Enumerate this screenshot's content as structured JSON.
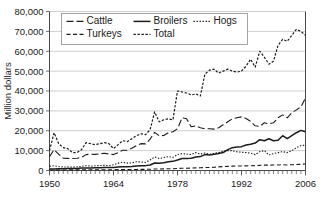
{
  "chart_data": {
    "type": "line",
    "title": "",
    "xlabel": "",
    "ylabel": "Million dollars",
    "xlim": [
      1950,
      2006
    ],
    "ylim": [
      0,
      80000
    ],
    "ytick_labels": [
      "0",
      "10,000",
      "20,000",
      "30,000",
      "40,000",
      "50,000",
      "60,000",
      "70,000",
      "80,000"
    ],
    "ytick_values": [
      0,
      10000,
      20000,
      30000,
      40000,
      50000,
      60000,
      70000,
      80000
    ],
    "xtick_labels": [
      "1950",
      "1964",
      "1978",
      "1992",
      "2006"
    ],
    "xtick_values": [
      1950,
      1964,
      1978,
      1992,
      2006
    ],
    "grid": "horizontal",
    "legend_position": "top-center",
    "x": [
      1950,
      1951,
      1952,
      1953,
      1954,
      1955,
      1956,
      1957,
      1958,
      1959,
      1960,
      1961,
      1962,
      1963,
      1964,
      1965,
      1966,
      1967,
      1968,
      1969,
      1970,
      1971,
      1972,
      1973,
      1974,
      1975,
      1976,
      1977,
      1978,
      1979,
      1980,
      1981,
      1982,
      1983,
      1984,
      1985,
      1986,
      1987,
      1988,
      1989,
      1990,
      1991,
      1992,
      1993,
      1994,
      1995,
      1996,
      1997,
      1998,
      1999,
      2000,
      2001,
      2002,
      2003,
      2004,
      2005,
      2006
    ],
    "series": [
      {
        "name": "Cattle",
        "dash": "dash-long",
        "values": [
          7000,
          10500,
          8200,
          6200,
          6100,
          6000,
          6200,
          6600,
          8000,
          8200,
          8100,
          8400,
          8700,
          8300,
          8000,
          9000,
          10200,
          10200,
          11200,
          12500,
          13500,
          13400,
          15800,
          19200,
          17500,
          17600,
          19000,
          19500,
          21000,
          26500,
          26000,
          22000,
          22500,
          21500,
          21000,
          21000,
          20800,
          21500,
          23000,
          24500,
          26000,
          26500,
          27000,
          26200,
          24700,
          22500,
          22200,
          24000,
          23500,
          24000,
          26500,
          28000,
          26500,
          29000,
          30500,
          32000,
          36500
        ]
      },
      {
        "name": "Broilers",
        "dash": "solid",
        "values": [
          700,
          800,
          850,
          900,
          950,
          1000,
          1050,
          1200,
          1300,
          1300,
          1350,
          1350,
          1450,
          1500,
          1550,
          1700,
          1900,
          1900,
          2050,
          2300,
          2450,
          2450,
          2800,
          3800,
          3600,
          3900,
          4400,
          4600,
          5300,
          6000,
          6000,
          6200,
          6800,
          7000,
          8000,
          7800,
          8200,
          8600,
          9000,
          10500,
          11500,
          11800,
          12000,
          12800,
          13200,
          13800,
          15500,
          15000,
          16000,
          15000,
          15200,
          17500,
          16000,
          17500,
          19000,
          20200,
          19500
        ]
      },
      {
        "name": "Hogs",
        "dash": "dot",
        "values": [
          2100,
          2400,
          2000,
          1700,
          1800,
          1700,
          1800,
          2100,
          2400,
          2200,
          2400,
          2500,
          2600,
          2500,
          2900,
          3700,
          4200,
          3700,
          3800,
          4400,
          4300,
          4100,
          5300,
          6800,
          6000,
          6500,
          7000,
          6600,
          8000,
          8500,
          8300,
          8000,
          9000,
          8300,
          8800,
          8200,
          8600,
          9000,
          9700,
          10000,
          10000,
          9400,
          9200,
          9000,
          8700,
          8000,
          9500,
          10000,
          7800,
          8500,
          9000,
          9500,
          9000,
          10000,
          11500,
          12500,
          12800
        ]
      },
      {
        "name": "Turkeys",
        "dash": "dash-short",
        "values": [
          230,
          270,
          280,
          280,
          290,
          290,
          300,
          320,
          350,
          340,
          350,
          360,
          380,
          370,
          390,
          420,
          460,
          470,
          500,
          540,
          560,
          580,
          630,
          750,
          760,
          800,
          880,
          900,
          1000,
          1100,
          1150,
          1200,
          1300,
          1350,
          1500,
          1500,
          1600,
          1800,
          1950,
          2100,
          2200,
          2250,
          2300,
          2350,
          2400,
          2450,
          2600,
          2700,
          2700,
          2750,
          2800,
          2900,
          2800,
          2900,
          3000,
          3100,
          3300
        ]
      },
      {
        "name": "Total",
        "dash": "dot-fine",
        "values": [
          10000,
          19000,
          13500,
          11500,
          11000,
          9000,
          9000,
          10500,
          14000,
          13500,
          13000,
          13500,
          14000,
          13500,
          11000,
          13000,
          15000,
          14500,
          16000,
          17500,
          18500,
          18000,
          20500,
          29500,
          24500,
          25500,
          26000,
          25500,
          40000,
          39500,
          39000,
          38000,
          38500,
          37500,
          48500,
          50500,
          51000,
          49000,
          50000,
          51000,
          50000,
          49500,
          50000,
          52500,
          56000,
          52000,
          60000,
          57000,
          53500,
          55000,
          63000,
          66000,
          65000,
          68000,
          71000,
          70000,
          68000
        ]
      }
    ]
  },
  "legend": {
    "items": [
      {
        "label": "Cattle"
      },
      {
        "label": "Broilers"
      },
      {
        "label": "Hogs"
      },
      {
        "label": "Turkeys"
      },
      {
        "label": "Total"
      }
    ]
  }
}
